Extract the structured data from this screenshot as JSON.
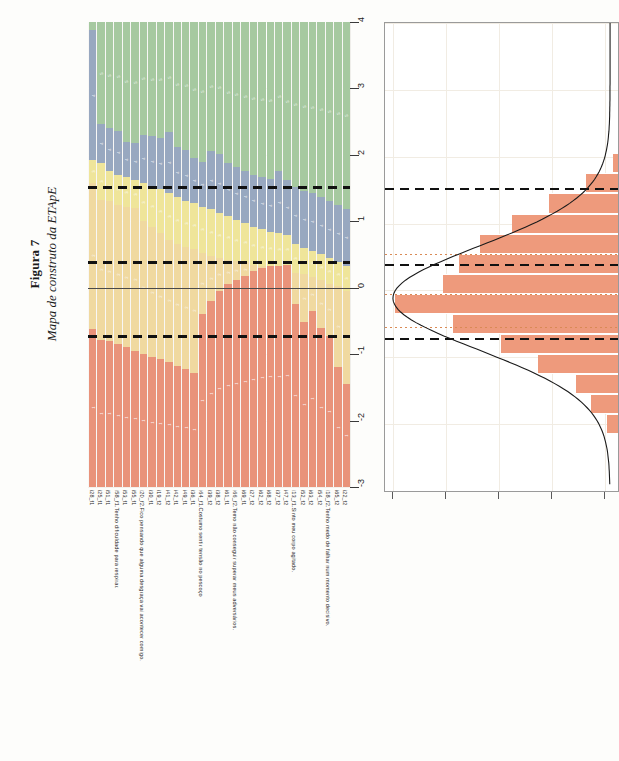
{
  "figure": {
    "number": "Figura 7",
    "caption": "Mapa de construto da ETApE"
  },
  "axis": {
    "ticks": [
      "4",
      "3",
      "2",
      "1",
      "0",
      "-1",
      "-2",
      "-3"
    ],
    "min": -3,
    "max": 4
  },
  "colors": {
    "category_5": "#a6c9a0",
    "category_4": "#98a8c0",
    "category_3": "#efe59a",
    "category_2": "#f0d9a0",
    "category_1": "#e9937a",
    "histogram_bar": "#ee9a7c",
    "threshold_line": "#111111",
    "dotted_line": "#d98a55"
  },
  "chart_data": {
    "type": "bar",
    "title": "Mapa de construto da ETApE",
    "xlabel": "",
    "ylabel": "",
    "ylim": [
      -3,
      4
    ],
    "grid": true,
    "legend": "none",
    "thresholds": [
      1.52,
      0.38,
      -0.72
    ],
    "zero_line": 0,
    "categories": [
      "i28_f1",
      "i25_f1",
      "i51_f1",
      "i58_f1",
      "i53_f1",
      "i55_f1",
      "i20_f2",
      "i30_f1",
      "i19_f2",
      "i41_f2",
      "i42_f1",
      "i49_f1",
      "i36_f1",
      "i64_f1",
      "i39_f2",
      "i38_f2",
      "i61_f1",
      "i66_f2",
      "i69_f1",
      "i27_f2",
      "i62_f2",
      "i68_f2",
      "i37_f2",
      "i47_f2",
      "i13_f1",
      "i52_f2",
      "i63_f2",
      "i54_f2",
      "i18_f2",
      "i65_f2",
      "i22_f2"
    ],
    "category_labels": [
      "i28_f1",
      "i25_f1",
      "i51_f1",
      "i58_f1.Tenho dificuldade para respirar.",
      "i53_f1",
      "i55_f1",
      "i20_f2.Fico pensando que alguma desgraça vai acontecer comigo.",
      "i30_f1",
      "i19_f2",
      "i41_f2",
      "i42_f1",
      "i49_f1",
      "i36_f1",
      "i64_f1.Costumo sentir tensão no pescoço",
      "i39_f2",
      "i38_f2",
      "i61_f1",
      "i66_f2.Temo não conseguir superar meus adversários.",
      "i69_f1",
      "i27_f2",
      "i62_f2",
      "i68_f2",
      "i37_f2",
      "i47_f2",
      "i13_f1.Sinto meu corpo agitado.",
      "i52_f2",
      "i63_f2",
      "i54_f2",
      "i18_f2.Tenho medo de falhar num momento decisivo.",
      "i65_f2",
      "i22_f2"
    ],
    "series": [
      {
        "name": "1",
        "color": "#e9937a",
        "boundaries_top": [
          -0.62,
          -0.78,
          -0.8,
          -0.85,
          -0.9,
          -0.95,
          -1.0,
          -1.05,
          -1.08,
          -1.12,
          -1.18,
          -1.22,
          -1.28,
          -0.4,
          -0.2,
          -0.05,
          0.05,
          0.12,
          0.18,
          0.25,
          0.3,
          0.35,
          0.38,
          0.42,
          -0.25,
          -0.52,
          -0.35,
          -0.6,
          -0.72,
          -1.2,
          -1.45
        ]
      },
      {
        "name": "2",
        "color": "#f0d9a0",
        "boundaries_top": [
          1.58,
          1.32,
          1.3,
          1.25,
          1.22,
          1.2,
          1.0,
          0.92,
          0.82,
          0.72,
          0.66,
          0.62,
          0.58,
          0.52,
          0.48,
          0.45,
          0.42,
          0.4,
          0.38,
          0.34,
          0.32,
          0.3,
          0.28,
          0.26,
          0.22,
          0.2,
          0.16,
          0.12,
          0.06,
          0.02,
          -0.05
        ]
      },
      {
        "name": "3",
        "color": "#efe59a",
        "boundaries_top": [
          1.92,
          1.88,
          1.76,
          1.7,
          1.66,
          1.62,
          1.58,
          1.52,
          1.48,
          1.42,
          1.36,
          1.3,
          1.28,
          1.22,
          1.18,
          1.12,
          1.08,
          1.02,
          0.98,
          0.92,
          0.88,
          0.82,
          0.78,
          0.72,
          0.66,
          0.6,
          0.56,
          0.5,
          0.44,
          0.38,
          0.32
        ]
      },
      {
        "name": "4",
        "color": "#98a8c0",
        "boundaries_top": [
          3.88,
          2.46,
          2.4,
          2.36,
          2.2,
          2.18,
          2.3,
          2.28,
          2.26,
          2.34,
          2.12,
          2.08,
          1.96,
          1.9,
          2.06,
          2.02,
          1.88,
          1.82,
          1.76,
          1.7,
          1.66,
          1.62,
          1.72,
          1.56,
          1.52,
          1.46,
          1.42,
          1.36,
          1.3,
          1.24,
          1.18
        ]
      },
      {
        "name": "5",
        "color": "#a6c9a0",
        "boundaries_top": [
          4,
          4,
          4,
          4,
          4,
          4,
          4,
          4,
          4,
          4,
          4,
          4,
          4,
          4,
          4,
          4,
          4,
          4,
          4,
          4,
          4,
          4,
          4,
          4,
          4,
          4,
          4,
          4,
          4,
          4,
          4
        ]
      }
    ]
  },
  "histogram": {
    "type": "bar",
    "orientation": "horizontal",
    "bins_center": [
      1.9,
      1.6,
      1.3,
      1.0,
      0.7,
      0.4,
      0.1,
      -0.2,
      -0.5,
      -0.8,
      -1.1,
      -1.4,
      -1.7,
      -2.0
    ],
    "counts": [
      2,
      12,
      26,
      40,
      52,
      60,
      66,
      84,
      62,
      44,
      30,
      16,
      10,
      4
    ],
    "max_count": 84,
    "curve": "normal-density-overlay",
    "thresholds": [
      1.52,
      0.38,
      -0.72
    ],
    "dotted_lines": [
      0.55,
      -0.05,
      -0.55
    ],
    "xticks": 5,
    "grid": true
  },
  "labels": {
    "items": [
      {
        "id": "i28_f1",
        "text": "i28_f1",
        "long": false
      },
      {
        "id": "i25_f1",
        "text": "i25_f1",
        "long": false
      },
      {
        "id": "i51_f1",
        "text": "i51_f1",
        "long": false
      },
      {
        "id": "i58_f1",
        "text": "i58_f1.Tenho dificuldade para respirar.",
        "long": true
      },
      {
        "id": "i53_f1",
        "text": "i53_f1",
        "long": false
      },
      {
        "id": "i55_f1",
        "text": "i55_f1",
        "long": false
      },
      {
        "id": "i20_f2",
        "text": "i20_f2.Fico pensando que alguma desgraça vai acontecer comigo.",
        "long": true
      },
      {
        "id": "i30_f1",
        "text": "i30_f1",
        "long": false
      },
      {
        "id": "i19_f2",
        "text": "i19_f2",
        "long": false
      },
      {
        "id": "i41_f2",
        "text": "i41_f2",
        "long": false
      },
      {
        "id": "i42_f1",
        "text": "i42_f1",
        "long": false
      },
      {
        "id": "i49_f1",
        "text": "i49_f1",
        "long": false
      },
      {
        "id": "i36_f1",
        "text": "i36_f1",
        "long": false
      },
      {
        "id": "i64_f1",
        "text": "i64_f1.Costumo sentir tensão no pescoço",
        "long": true
      },
      {
        "id": "i39_f2",
        "text": "i39_f2",
        "long": false
      },
      {
        "id": "i38_f2",
        "text": "i38_f2",
        "long": false
      },
      {
        "id": "i61_f1",
        "text": "i61_f1",
        "long": false
      },
      {
        "id": "i66_f2",
        "text": "i66_f2.Temo não conseguir superar meus adversários.",
        "long": true
      },
      {
        "id": "i69_f1",
        "text": "i69_f1",
        "long": false
      },
      {
        "id": "i27_f2",
        "text": "i27_f2",
        "long": false
      },
      {
        "id": "i62_f2",
        "text": "i62_f2",
        "long": false
      },
      {
        "id": "i68_f2",
        "text": "i68_f2",
        "long": false
      },
      {
        "id": "i37_f2",
        "text": "i37_f2",
        "long": false
      },
      {
        "id": "i47_f2",
        "text": "i47_f2",
        "long": false
      },
      {
        "id": "i13_f1",
        "text": "i13_f1.Sinto meu corpo agitado.",
        "long": true
      },
      {
        "id": "i52_f2",
        "text": "i52_f2",
        "long": false
      },
      {
        "id": "i63_f2",
        "text": "i63_f2",
        "long": false
      },
      {
        "id": "i54_f2",
        "text": "i54_f2",
        "long": false
      },
      {
        "id": "i18_f2",
        "text": "i18_f2.Tenho medo de falhar num momento decisivo.",
        "long": true
      },
      {
        "id": "i65_f2",
        "text": "i65_f2",
        "long": false
      },
      {
        "id": "i22_f2",
        "text": "i22_f2",
        "long": false
      }
    ]
  }
}
